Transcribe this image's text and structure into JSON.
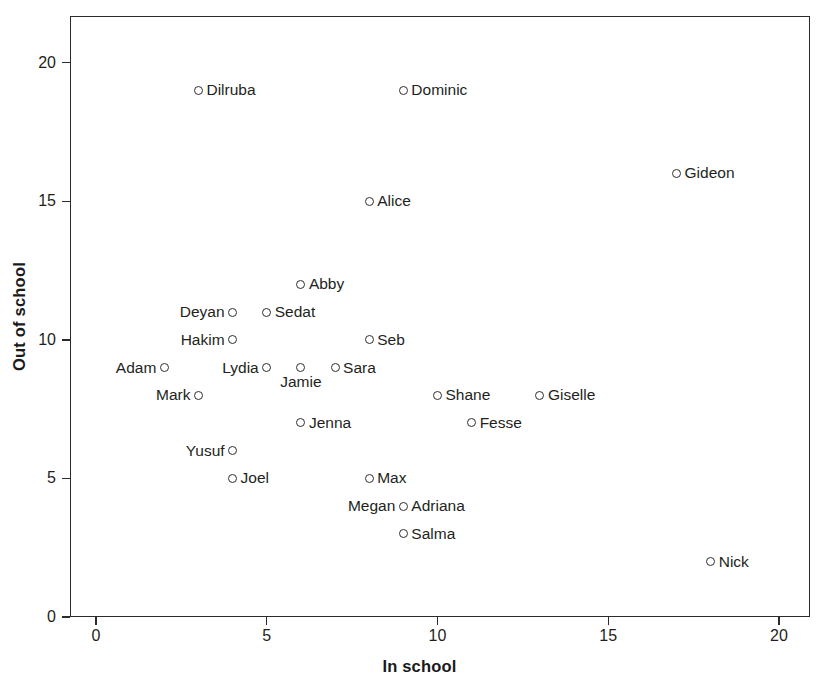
{
  "chart_data": {
    "type": "scatter",
    "title": "",
    "xlabel": "In school",
    "ylabel": "Out of school",
    "xlim": [
      -0.8,
      21.2
    ],
    "ylim": [
      0,
      21.7
    ],
    "xticks": [
      0,
      5,
      10,
      15,
      20
    ],
    "yticks": [
      0,
      5,
      10,
      15,
      20
    ],
    "xtick_labels": [
      "0",
      "5",
      "10",
      "15",
      "20"
    ],
    "ytick_labels": [
      "0",
      "5",
      "10",
      "15",
      "20"
    ],
    "grid": false,
    "legend": "none",
    "marker_style": "open-circle",
    "marker_color": "#2f2f2f",
    "points": [
      {
        "label": "Dilruba",
        "x": 3,
        "y": 19,
        "label_pos": "right"
      },
      {
        "label": "Dominic",
        "x": 9,
        "y": 19,
        "label_pos": "right"
      },
      {
        "label": "Gideon",
        "x": 17,
        "y": 16,
        "label_pos": "right"
      },
      {
        "label": "Alice",
        "x": 8,
        "y": 15,
        "label_pos": "right"
      },
      {
        "label": "Abby",
        "x": 6,
        "y": 12,
        "label_pos": "right"
      },
      {
        "label": "Deyan",
        "x": 4,
        "y": 11,
        "label_pos": "left"
      },
      {
        "label": "Sedat",
        "x": 5,
        "y": 11,
        "label_pos": "right"
      },
      {
        "label": "Hakim",
        "x": 4,
        "y": 10,
        "label_pos": "left"
      },
      {
        "label": "Seb",
        "x": 8,
        "y": 10,
        "label_pos": "right"
      },
      {
        "label": "Adam",
        "x": 2,
        "y": 9,
        "label_pos": "left"
      },
      {
        "label": "Lydia",
        "x": 5,
        "y": 9,
        "label_pos": "left"
      },
      {
        "label": "Jamie",
        "x": 6,
        "y": 9,
        "label_pos": "below"
      },
      {
        "label": "Sara",
        "x": 7,
        "y": 9,
        "label_pos": "right"
      },
      {
        "label": "Mark",
        "x": 3,
        "y": 8,
        "label_pos": "left"
      },
      {
        "label": "Shane",
        "x": 10,
        "y": 8,
        "label_pos": "right"
      },
      {
        "label": "Giselle",
        "x": 13,
        "y": 8,
        "label_pos": "right"
      },
      {
        "label": "Jenna",
        "x": 6,
        "y": 7,
        "label_pos": "right"
      },
      {
        "label": "Fesse",
        "x": 11,
        "y": 7,
        "label_pos": "right"
      },
      {
        "label": "Yusuf",
        "x": 4,
        "y": 6,
        "label_pos": "left"
      },
      {
        "label": "Joel",
        "x": 4,
        "y": 5,
        "label_pos": "right"
      },
      {
        "label": "Max",
        "x": 8,
        "y": 5,
        "label_pos": "right"
      },
      {
        "label": "Megan",
        "x": 9,
        "y": 4,
        "label_pos": "left"
      },
      {
        "label": "Adriana",
        "x": 9,
        "y": 4,
        "label_pos": "right"
      },
      {
        "label": "Salma",
        "x": 9,
        "y": 3,
        "label_pos": "right"
      },
      {
        "label": "Nick",
        "x": 18,
        "y": 2,
        "label_pos": "right"
      }
    ]
  }
}
